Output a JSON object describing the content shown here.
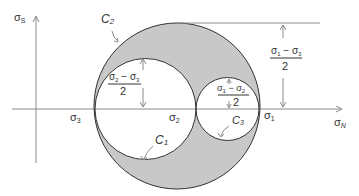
{
  "colors": {
    "shaded_region": "#c8c8c8",
    "circle_stroke": "#333333",
    "axis_stroke": "#8a8a8a",
    "text": "#333333"
  },
  "axes": {
    "vertical_label": {
      "symbol": "σ",
      "subscript": "S"
    },
    "horizontal_label": {
      "symbol": "σ",
      "subscript": "N"
    }
  },
  "points": {
    "sigma3": {
      "symbol": "σ",
      "subscript": "3"
    },
    "sigma2": {
      "symbol": "σ",
      "subscript": "2"
    },
    "sigma1": {
      "symbol": "σ",
      "subscript": "1"
    }
  },
  "circles": {
    "c1": {
      "label": "C",
      "subscript": "1"
    },
    "c2": {
      "label": "C",
      "subscript": "2"
    },
    "c3": {
      "label": "C",
      "subscript": "3"
    }
  },
  "radii": {
    "r_c1": {
      "num_a": "σ",
      "num_a_sub": "2",
      "minus": " − ",
      "num_b": "σ",
      "num_b_sub": "3",
      "den": "2"
    },
    "r_c3": {
      "num_a": "σ",
      "num_a_sub": "1",
      "minus": " − ",
      "num_b": "σ",
      "num_b_sub": "2",
      "den": "2"
    },
    "r_c2": {
      "num_a": "σ",
      "num_a_sub": "1",
      "minus": " − ",
      "num_b": "σ",
      "num_b_sub": "3",
      "den": "2"
    }
  }
}
